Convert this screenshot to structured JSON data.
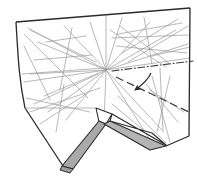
{
  "figure": {
    "title": "Origami folding step diagram",
    "background_color": "#ffffff"
  },
  "colors": {
    "outline": "#2b2b2b",
    "crease": "#8a8a8a",
    "crease_light": "#a8a8a8",
    "shaded_fill": "#a9a9a9",
    "shaded_fill_light": "#bdbdbd",
    "white_fill": "#ffffff",
    "fold_line": "#3a3a3a",
    "arrow": "#2b2b2b"
  },
  "geometry": {
    "sheet_outline": "16,22 190,8 189,135 166,146 110,128 95,108 62,167 25,110",
    "sheet_outline_simple": "16,22 190,8 189,136 70,168 22,104",
    "outer_points": [
      {
        "name": "top-left-corner",
        "x": 16,
        "y": 22
      },
      {
        "name": "top-right-corner",
        "x": 190,
        "y": 8
      },
      {
        "name": "bottom-right-corner",
        "x": 189,
        "y": 136
      },
      {
        "name": "bottom-tip",
        "x": 68,
        "y": 168
      },
      {
        "name": "left-mid",
        "x": 21,
        "y": 103
      }
    ],
    "hub": {
      "name": "central-hub",
      "x": 106,
      "y": 70
    },
    "pleat_shaded": "106,123 96,110 62,167 73,169",
    "pleat_shaded_right": "98,124 113,115 166,146 150,149",
    "pleat_white_top": "95,108 112,114 165,145 152,133 113,122",
    "fold_dashdot": "112,71 193,61",
    "fold_dashed": "117,78 191,112",
    "arrow_path": "M150,74 C146,80 140,84 133,90",
    "arrow_tip": {
      "x": 131,
      "y": 92
    }
  },
  "creases": {
    "label": "crease-pattern-lines",
    "note": "light grey construction / crease lines over the sheet",
    "lines": [
      "28,28 106,70",
      "106,70 44,96",
      "106,70 24,82",
      "106,70 30,74",
      "106,70 38,42",
      "106,70 64,26",
      "106,70 90,22",
      "106,70 106,16",
      "106,70 122,18",
      "106,70 150,22",
      "106,70 176,30",
      "106,70 188,44",
      "106,70 190,58",
      "106,70 104,126",
      "106,70 66,120",
      "106,70 48,112",
      "106,70 162,130",
      "106,70 150,140",
      "30,30 96,62",
      "24,34 88,98",
      "22,74 104,68",
      "24,46 50,100",
      "34,104 98,74",
      "30,112 100,88",
      "60,88 72,30",
      "48,42 84,38",
      "36,60 90,56",
      "26,98 88,112",
      "56,130 64,86",
      "40,122 84,96",
      "118,34 180,24",
      "112,38 188,36",
      "116,46 186,52",
      "120,26 168,64",
      "122,52 176,20",
      "144,18 152,64",
      "110,30 164,66",
      "128,62 188,26",
      "152,56 190,48",
      "160,70 162,132",
      "152,76 168,140",
      "168,78 158,132",
      "146,84 176,120",
      "150,88 182,110",
      "118,96 164,142",
      "112,104 152,138"
    ],
    "star_intersections": [
      {
        "name": "star-upper-left",
        "x": 60,
        "y": 34
      },
      {
        "name": "star-left",
        "x": 44,
        "y": 74
      },
      {
        "name": "star-lower-left",
        "x": 58,
        "y": 106
      },
      {
        "name": "star-upper-right",
        "x": 140,
        "y": 30
      },
      {
        "name": "star-right",
        "x": 170,
        "y": 48
      },
      {
        "name": "star-lower-right",
        "x": 160,
        "y": 86
      }
    ]
  },
  "annotations": {
    "valley_fold_line_style": "dash-dot",
    "mountain_fold_line_style": "dashed",
    "fold_arrow": "curved-fold-arrow"
  }
}
